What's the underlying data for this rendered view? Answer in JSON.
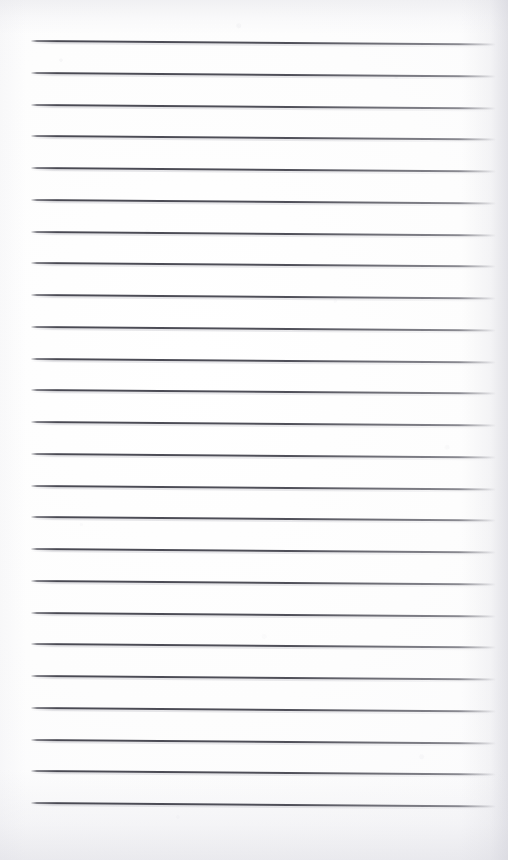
{
  "document": {
    "kind": "scanned-ruled-notepad-page",
    "title": "Blank ruled notepad page",
    "page_width": 508,
    "page_height": 860,
    "orientation": "portrait",
    "text_content": "",
    "has_handwriting": false,
    "has_printed_text": false
  },
  "paper": {
    "background_color": "#fdfdfd",
    "edge_shadow_color": "#d6d6de",
    "grain_color": "#cacad4"
  },
  "ruling": {
    "line_color": "#42424c",
    "line_count": 25,
    "line_thickness_px": 2,
    "line_spacing_px": 31.75,
    "first_line_y_px": 40,
    "last_line_y_px": 802,
    "left_margin_px": 31,
    "right_end_px": 496,
    "skew_degrees": 0.42,
    "lines": [
      {
        "index": 1,
        "y": 40.0
      },
      {
        "index": 2,
        "y": 71.8
      },
      {
        "index": 3,
        "y": 103.5
      },
      {
        "index": 4,
        "y": 135.3
      },
      {
        "index": 5,
        "y": 167.0
      },
      {
        "index": 6,
        "y": 198.8
      },
      {
        "index": 7,
        "y": 230.5
      },
      {
        "index": 8,
        "y": 262.3
      },
      {
        "index": 9,
        "y": 294.0
      },
      {
        "index": 10,
        "y": 325.8
      },
      {
        "index": 11,
        "y": 357.5
      },
      {
        "index": 12,
        "y": 389.3
      },
      {
        "index": 13,
        "y": 421.0
      },
      {
        "index": 14,
        "y": 452.8
      },
      {
        "index": 15,
        "y": 484.5
      },
      {
        "index": 16,
        "y": 516.3
      },
      {
        "index": 17,
        "y": 548.0
      },
      {
        "index": 18,
        "y": 579.8
      },
      {
        "index": 19,
        "y": 611.5
      },
      {
        "index": 20,
        "y": 643.3
      },
      {
        "index": 21,
        "y": 675.0
      },
      {
        "index": 22,
        "y": 706.8
      },
      {
        "index": 23,
        "y": 738.5
      },
      {
        "index": 24,
        "y": 770.3
      },
      {
        "index": 25,
        "y": 802.0
      }
    ]
  }
}
